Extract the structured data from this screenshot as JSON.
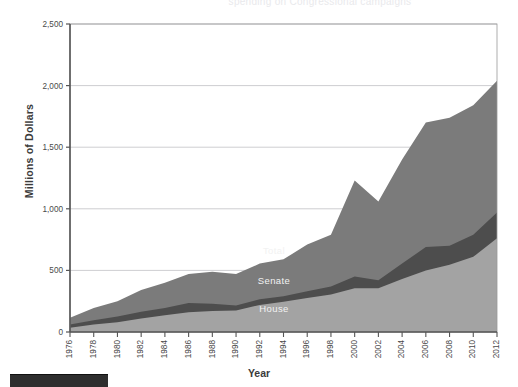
{
  "figure": {
    "top_clipped_text": "spending on Congressional campaigns",
    "footer_bar_label": ""
  },
  "chart_data": {
    "type": "area",
    "stacked": false,
    "title": "",
    "subtitle": "",
    "xlabel": "Year",
    "ylabel": "Millions of Dollars",
    "xlim": [
      1976,
      2012
    ],
    "ylim": [
      0,
      2500
    ],
    "ytick_labels": [
      "0",
      "500",
      "1,000",
      "1,500",
      "2,000",
      "2,500"
    ],
    "ytick_values": [
      0,
      500,
      1000,
      1500,
      2000,
      2500
    ],
    "grid": true,
    "grid_axis": "y",
    "legend": "inline-labels",
    "x": [
      1976,
      1978,
      1980,
      1982,
      1984,
      1986,
      1988,
      1990,
      1992,
      1994,
      1996,
      1998,
      2000,
      2002,
      2004,
      2006,
      2008,
      2010,
      2012
    ],
    "categories": [
      "1976",
      "1978",
      "1980",
      "1982",
      "1984",
      "1986",
      "1988",
      "1990",
      "1992",
      "1994",
      "1996",
      "1998",
      "2000",
      "2002",
      "2004",
      "2006",
      "2008",
      "2010",
      "2012"
    ],
    "series": [
      {
        "name": "Total",
        "label": "Total",
        "color": "#7b7b7b",
        "values": [
          115,
          195,
          250,
          340,
          400,
          470,
          490,
          470,
          555,
          590,
          710,
          790,
          1230,
          1060,
          1400,
          1700,
          1740,
          1840,
          2040
        ]
      },
      {
        "name": "Senate",
        "label": "Senate",
        "color": "#4d4d4d",
        "values": [
          60,
          95,
          125,
          165,
          195,
          235,
          230,
          215,
          265,
          290,
          330,
          370,
          450,
          420,
          555,
          690,
          700,
          790,
          970
        ]
      },
      {
        "name": "House",
        "label": "House",
        "color": "#a3a3a3",
        "values": [
          35,
          60,
          80,
          110,
          135,
          160,
          170,
          175,
          220,
          245,
          275,
          305,
          355,
          355,
          430,
          500,
          545,
          610,
          760
        ]
      }
    ],
    "series_label_positions": [
      {
        "name": "Total",
        "x": 1993.2,
        "y": 630
      },
      {
        "name": "Senate",
        "x": 1993.2,
        "y": 390
      },
      {
        "name": "House",
        "x": 1993.2,
        "y": 160
      }
    ],
    "colors": {
      "total": "#7b7b7b",
      "senate": "#4d4d4d",
      "house": "#a3a3a3",
      "axis": "#5a5a5a",
      "grid": "#b9b9bd",
      "background": "#ffffff",
      "label_text": "#f2f2f2"
    }
  }
}
